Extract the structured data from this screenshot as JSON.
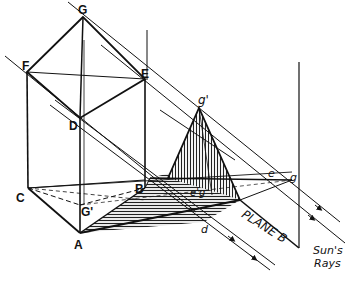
{
  "figure": {
    "labels": {
      "G": "G",
      "F": "F",
      "E": "E",
      "D": "D",
      "C": "C",
      "B": "B",
      "A": "A",
      "Gp": "G'",
      "gp": "g'",
      "e": "e",
      "g": "g",
      "d": "d",
      "eg": "e'g",
      "plane": "PLANE B",
      "sun1": "Sun's",
      "sun2": "Rays"
    },
    "colors": {
      "ink": "#111111",
      "hatch": "#555555",
      "background": "#ffffff"
    }
  }
}
